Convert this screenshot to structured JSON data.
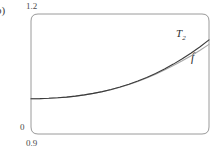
{
  "figure": {
    "panel_label": "b)",
    "background_color": "#ffffff",
    "frame_color": "#9a9a9a"
  },
  "axes": {
    "y_max_label": "1.2",
    "y_min_label": "0",
    "x_min_label": "0.9",
    "frame": {
      "x0": 31,
      "y0": 14,
      "x1": 209,
      "y1": 134,
      "corner_radius": 7
    }
  },
  "curves": {
    "taylor_label": "T",
    "taylor_sub": "2",
    "function_label": "f",
    "taylor_color": "#3b3b3b",
    "function_color": "#a8a8a8"
  },
  "chart_data": {
    "type": "line",
    "title": "",
    "xlabel": "",
    "ylabel": "",
    "xlim": [
      0.9,
      1.2
    ],
    "ylim": [
      0,
      1.2
    ],
    "xticks": [
      0.9
    ],
    "xticklabels": [
      "0.9"
    ],
    "yticks": [
      0,
      1.2
    ],
    "yticklabels": [
      "0",
      "1.2"
    ],
    "grid": false,
    "legend": "inline-annotations",
    "annotations": [
      {
        "text": "T_2",
        "x": 1.158,
        "y": 0.94
      },
      {
        "text": "f",
        "x": 1.182,
        "y": 0.8
      }
    ],
    "series": [
      {
        "name": "T_2",
        "label": "T₂",
        "color": "#3b3b3b",
        "x": [
          0.9,
          0.915,
          0.93,
          0.945,
          0.96,
          0.975,
          0.99,
          1.005,
          1.02,
          1.035,
          1.05,
          1.065,
          1.08,
          1.095,
          1.11,
          1.125,
          1.14,
          1.155,
          1.17,
          1.185,
          1.2
        ],
        "y": [
          0.353,
          0.354,
          0.357,
          0.362,
          0.369,
          0.379,
          0.391,
          0.406,
          0.424,
          0.445,
          0.47,
          0.498,
          0.53,
          0.566,
          0.606,
          0.65,
          0.699,
          0.752,
          0.81,
          0.873,
          0.941
        ]
      },
      {
        "name": "f",
        "label": "f",
        "color": "#a8a8a8",
        "x": [
          0.9,
          0.915,
          0.93,
          0.945,
          0.96,
          0.975,
          0.99,
          1.005,
          1.02,
          1.035,
          1.05,
          1.065,
          1.08,
          1.095,
          1.11,
          1.125,
          1.14,
          1.155,
          1.17,
          1.185,
          1.2
        ],
        "y": [
          0.353,
          0.354,
          0.357,
          0.362,
          0.369,
          0.379,
          0.391,
          0.406,
          0.423,
          0.444,
          0.468,
          0.495,
          0.526,
          0.56,
          0.598,
          0.639,
          0.684,
          0.732,
          0.783,
          0.838,
          0.896
        ]
      }
    ]
  }
}
